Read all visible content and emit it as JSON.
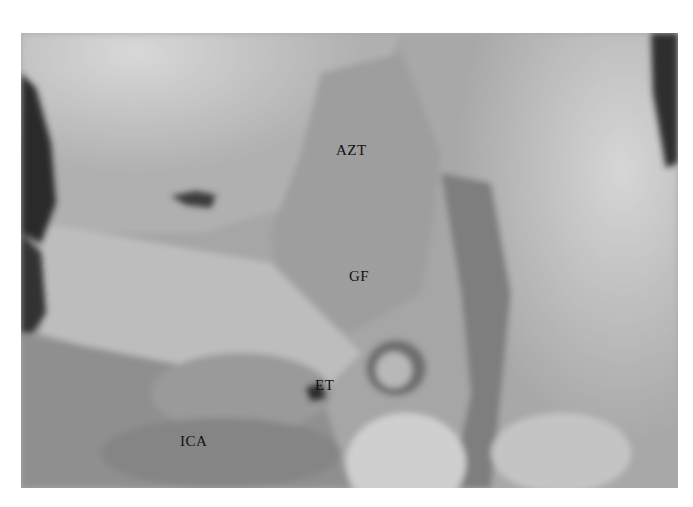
{
  "figure": {
    "type": "grayscale anatomical dissection photograph",
    "labels": [
      {
        "id": "azt",
        "text": "AZT",
        "x": 336,
        "y": 150
      },
      {
        "id": "gf",
        "text": "GF",
        "x": 349,
        "y": 276
      },
      {
        "id": "et",
        "text": "ET",
        "x": 315,
        "y": 385
      },
      {
        "id": "ica",
        "text": "ICA",
        "x": 180,
        "y": 441
      }
    ]
  }
}
